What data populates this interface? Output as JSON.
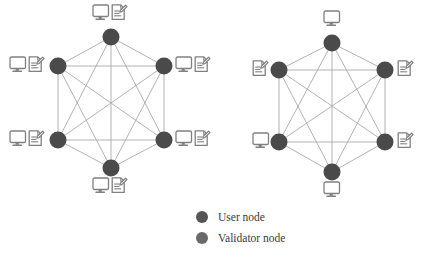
{
  "figure": {
    "background_color": "#ffffff",
    "node_color": "#4a4a4a",
    "edge_color": "#a9a9a9",
    "icon_color": "#787878",
    "label_color": "#3a3a3a"
  },
  "diagrams": [
    {
      "id": "left-network",
      "name": "fully-connected-user-network",
      "topology": "complete-graph",
      "node_count": 6,
      "edge_count": 15,
      "center": {
        "x": 111,
        "y": 102
      },
      "radius_x": 53,
      "radius_y": 65,
      "node_radius": 8.5,
      "nodes": [
        {
          "id": "L1",
          "label": "top",
          "x": 111,
          "y": 37,
          "role": "user",
          "icons": [
            "monitor-icon",
            "document-pen-icon"
          ],
          "icon_placement": "above",
          "icon_x": 92,
          "icon_y": 4
        },
        {
          "id": "L2",
          "label": "upper-right",
          "x": 164,
          "y": 66,
          "role": "user",
          "icons": [
            "monitor-icon",
            "document-pen-icon"
          ],
          "icon_placement": "right",
          "icon_x": 175,
          "icon_y": 56
        },
        {
          "id": "L3",
          "label": "lower-right",
          "x": 164,
          "y": 140,
          "role": "user",
          "icons": [
            "monitor-icon",
            "document-pen-icon"
          ],
          "icon_placement": "right",
          "icon_x": 175,
          "icon_y": 130
        },
        {
          "id": "L4",
          "label": "bottom",
          "x": 111,
          "y": 168,
          "role": "user",
          "icons": [
            "monitor-icon",
            "document-pen-icon"
          ],
          "icon_placement": "below",
          "icon_x": 92,
          "icon_y": 177
        },
        {
          "id": "L5",
          "label": "lower-left",
          "x": 58,
          "y": 140,
          "role": "user",
          "icons": [
            "monitor-icon",
            "document-pen-icon"
          ],
          "icon_placement": "left",
          "icon_x": 9,
          "icon_y": 130
        },
        {
          "id": "L6",
          "label": "upper-left",
          "x": 58,
          "y": 66,
          "role": "user",
          "icons": [
            "monitor-icon",
            "document-pen-icon"
          ],
          "icon_placement": "left",
          "icon_x": 9,
          "icon_y": 56
        }
      ]
    },
    {
      "id": "right-network",
      "name": "fully-connected-validator-network",
      "topology": "complete-graph",
      "node_count": 6,
      "edge_count": 15,
      "center": {
        "x": 332,
        "y": 107
      },
      "radius_x": 53,
      "radius_y": 65,
      "node_radius": 8.5,
      "nodes": [
        {
          "id": "R1",
          "label": "top",
          "x": 332,
          "y": 43,
          "role": "validator",
          "icons": [
            "monitor-icon"
          ],
          "icon_placement": "above",
          "icon_x": 323,
          "icon_y": 10
        },
        {
          "id": "R2",
          "label": "upper-right",
          "x": 385,
          "y": 70,
          "role": "validator",
          "icons": [
            "document-pen-icon"
          ],
          "icon_placement": "right",
          "icon_x": 397,
          "icon_y": 60
        },
        {
          "id": "R3",
          "label": "lower-right",
          "x": 385,
          "y": 142,
          "role": "validator",
          "icons": [
            "document-pen-icon"
          ],
          "icon_placement": "right",
          "icon_x": 397,
          "icon_y": 132
        },
        {
          "id": "R4",
          "label": "bottom",
          "x": 332,
          "y": 172,
          "role": "validator",
          "icons": [
            "monitor-icon"
          ],
          "icon_placement": "below",
          "icon_x": 323,
          "icon_y": 181
        },
        {
          "id": "R5",
          "label": "lower-left",
          "x": 279,
          "y": 142,
          "role": "validator",
          "icons": [
            "monitor-icon"
          ],
          "icon_placement": "left",
          "icon_x": 252,
          "icon_y": 132
        },
        {
          "id": "R6",
          "label": "upper-left",
          "x": 279,
          "y": 70,
          "role": "validator",
          "icons": [
            "document-pen-icon"
          ],
          "icon_placement": "left",
          "icon_x": 252,
          "icon_y": 60
        }
      ]
    }
  ],
  "legend": {
    "x": 196,
    "y": 212,
    "items": [
      {
        "key": "user",
        "label": "User node",
        "color": "#555555",
        "marker": "filled-circle",
        "dot_x": 202,
        "dot_y": 217,
        "text_x": 218,
        "text_y": 221
      },
      {
        "key": "validator",
        "label": "Validator node",
        "color": "#6a6a6a",
        "marker": "filled-circle",
        "dot_x": 202,
        "dot_y": 238,
        "text_x": 218,
        "text_y": 242
      }
    ]
  }
}
